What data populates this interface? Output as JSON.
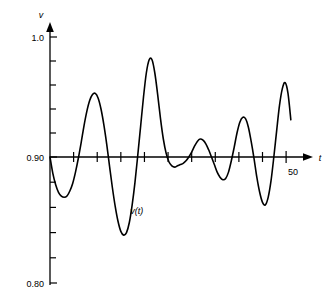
{
  "chart_data": {
    "type": "line",
    "title": "",
    "xlabel": "t",
    "ylabel": "v",
    "series_label": "v(t)",
    "xlim": [
      0,
      54
    ],
    "ylim": [
      0.8,
      1.005
    ],
    "grid": false,
    "legend": "none",
    "y_tick_labels": [
      "1.0",
      "0.90",
      "0.80"
    ],
    "y_tick_values": [
      1.0,
      0.9,
      0.8
    ],
    "y_minor_tick_values": [
      0.98,
      0.96,
      0.94,
      0.92,
      0.88,
      0.86,
      0.84,
      0.82
    ],
    "x_tick_labels": [
      "50"
    ],
    "x_tick_values": [
      50
    ],
    "x_minor_tick_values": [
      5,
      10,
      15,
      20,
      25,
      30,
      35,
      40,
      45
    ],
    "annotations": [
      {
        "text": "v(t)",
        "x": 17,
        "y": 0.855
      }
    ],
    "x": [
      0.0,
      0.6,
      1.2,
      1.8,
      2.4,
      3.0,
      3.6,
      4.2,
      4.8,
      5.4,
      6.0,
      6.6,
      7.2,
      7.8,
      8.4,
      9.0,
      9.6,
      10.2,
      10.8,
      11.4,
      12.0,
      12.6,
      13.2,
      13.8,
      14.4,
      15.0,
      15.6,
      16.2,
      16.8,
      17.4,
      18.0,
      18.6,
      19.2,
      19.8,
      20.4,
      21.0,
      21.6,
      22.2,
      22.8,
      23.4,
      24.0,
      24.6,
      25.2,
      25.8,
      26.4,
      27.0,
      27.6,
      28.2,
      28.8,
      29.4,
      30.0,
      30.6,
      31.2,
      31.8,
      32.4,
      33.0,
      33.6,
      34.2,
      34.8,
      35.4,
      36.0,
      36.6,
      37.2,
      37.8,
      38.4,
      39.0,
      39.6,
      40.2,
      40.8,
      41.4,
      42.0,
      42.6,
      43.2,
      43.8,
      44.4,
      45.0,
      45.6,
      46.2,
      46.8,
      47.4,
      48.0,
      48.6,
      49.2,
      49.8,
      50.4,
      51.0
    ],
    "y": [
      0.9,
      0.887,
      0.878,
      0.872,
      0.869,
      0.868,
      0.869,
      0.873,
      0.879,
      0.888,
      0.899,
      0.912,
      0.926,
      0.938,
      0.947,
      0.952,
      0.953,
      0.949,
      0.94,
      0.927,
      0.911,
      0.893,
      0.876,
      0.861,
      0.849,
      0.841,
      0.838,
      0.84,
      0.848,
      0.862,
      0.88,
      0.902,
      0.926,
      0.95,
      0.97,
      0.981,
      0.981,
      0.97,
      0.952,
      0.932,
      0.915,
      0.903,
      0.896,
      0.893,
      0.892,
      0.893,
      0.894,
      0.895,
      0.897,
      0.9,
      0.904,
      0.909,
      0.913,
      0.915,
      0.914,
      0.911,
      0.906,
      0.9,
      0.894,
      0.888,
      0.884,
      0.882,
      0.883,
      0.888,
      0.897,
      0.908,
      0.92,
      0.929,
      0.933,
      0.932,
      0.925,
      0.913,
      0.899,
      0.884,
      0.872,
      0.864,
      0.862,
      0.868,
      0.881,
      0.9,
      0.922,
      0.943,
      0.957,
      0.962,
      0.953,
      0.931
    ]
  },
  "axes": {
    "y_axis_name": "v",
    "x_axis_name": "t",
    "y_top_label": "1.0",
    "y_mid_label": "0.90",
    "y_bottom_label": "0.80",
    "x_end_label": "50"
  },
  "curve": {
    "label": "v(t)",
    "color": "#000000",
    "line_width": 1.6
  }
}
